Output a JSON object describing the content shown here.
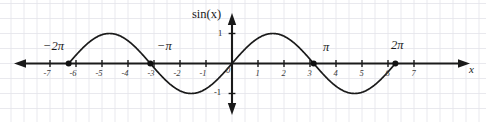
{
  "figure": {
    "kind": "cartesian-plot",
    "y_axis_label": "sin(x)",
    "x_axis_label": "x",
    "colors": {
      "background": "#ffffff",
      "grid": "#e3e3ea",
      "axis": "#1a1a1a",
      "curve": "#1a1a1a",
      "marker": "#111111",
      "tick_text": "#3a3a3a"
    }
  },
  "chart_data": {
    "type": "line",
    "title": "",
    "subtitle": "",
    "xlabel": "x",
    "ylabel": "sin(x)",
    "xlim": [
      -7.6,
      7.6
    ],
    "ylim": [
      -1.62,
      1.62
    ],
    "grid": true,
    "grid_step": 0.5,
    "legend": "none",
    "function": "y = sin(x)",
    "x_ticks": [
      -7,
      -6,
      -5,
      -4,
      -3,
      -2,
      -1,
      0,
      1,
      2,
      3,
      4,
      5,
      6,
      7
    ],
    "x_tick_labels": [
      "-7",
      "-6",
      "-5",
      "-4",
      "-3",
      "-2",
      "-1",
      "0",
      "1",
      "2",
      "3",
      "4",
      "5",
      "6",
      "7"
    ],
    "y_ticks": [
      -1,
      1
    ],
    "y_tick_labels": [
      "-1",
      "1"
    ],
    "series": [
      {
        "name": "sin(x)",
        "x": [
          -6.2832,
          -6.0,
          -5.5,
          -5.0,
          -4.7124,
          -4.5,
          -4.0,
          -3.5,
          -3.1416,
          -3.0,
          -2.5,
          -2.0,
          -1.5708,
          -1.5,
          -1.0,
          -0.5,
          0.0,
          0.5,
          1.0,
          1.5,
          1.5708,
          2.0,
          2.5,
          3.0,
          3.1416,
          3.5,
          4.0,
          4.5,
          4.7124,
          5.0,
          5.5,
          6.0,
          6.2832
        ],
        "y": [
          0.0,
          0.2794,
          0.7055,
          0.9589,
          1.0,
          0.9775,
          0.7568,
          0.3508,
          0.0,
          -0.1411,
          -0.5985,
          -0.9093,
          -1.0,
          -0.9975,
          -0.8415,
          -0.4794,
          0.0,
          0.4794,
          0.8415,
          0.9975,
          1.0,
          0.9093,
          0.5985,
          0.1411,
          0.0,
          -0.3508,
          -0.7568,
          -0.9775,
          -1.0,
          -0.9589,
          -0.7055,
          -0.2794,
          0.0
        ]
      }
    ],
    "annotations": [
      {
        "name": "minus-two-pi",
        "text": "-2π",
        "x": -6.2832,
        "y": 0,
        "marker": true
      },
      {
        "name": "minus-pi",
        "text": "-π",
        "x": -3.1416,
        "y": 0,
        "marker": true
      },
      {
        "name": "pi",
        "text": "π",
        "x": 3.1416,
        "y": 0,
        "marker": true
      },
      {
        "name": "two-pi",
        "text": "2π",
        "x": 6.2832,
        "y": 0,
        "marker": true
      }
    ]
  },
  "labels": {
    "sin_of_x": "sin(x)",
    "x_axis": "x",
    "y_one": "1",
    "y_minus_one": "-1",
    "origin": "0",
    "minus_two_pi": "−2π",
    "minus_pi": "−π",
    "pi": "π",
    "two_pi": "2π",
    "x_ticks": [
      "-7",
      "-6",
      "-5",
      "-4",
      "-3",
      "-2",
      "-1",
      "1",
      "2",
      "3",
      "4",
      "5",
      "6",
      "7"
    ]
  }
}
